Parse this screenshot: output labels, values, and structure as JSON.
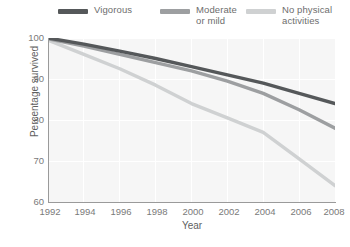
{
  "chart_data": {
    "type": "line",
    "title": "",
    "xlabel": "Year",
    "ylabel": "Percentage survived",
    "xlim": [
      1992,
      2008
    ],
    "ylim": [
      60,
      100
    ],
    "xticks": [
      1992,
      1994,
      1996,
      1998,
      2000,
      2002,
      2004,
      2006,
      2008
    ],
    "yticks": [
      60,
      70,
      80,
      90,
      100
    ],
    "grid": true,
    "legend_position": "top",
    "x": [
      1992,
      1994,
      1996,
      1998,
      2000,
      2002,
      2004,
      2006,
      2008
    ],
    "series": [
      {
        "name": "Vigorous",
        "color": "#55585a",
        "values": [
          100,
          98.5,
          96.8,
          95.0,
          93.0,
          91.0,
          89.0,
          86.5,
          84.0
        ]
      },
      {
        "name": "Moderate or mild",
        "color": "#9d9fa1",
        "values": [
          99.8,
          98.0,
          96.0,
          94.0,
          92.0,
          89.5,
          86.5,
          82.5,
          78.0
        ]
      },
      {
        "name": "No physical activities",
        "color": "#cfd1d2",
        "values": [
          99.5,
          96.0,
          92.5,
          88.5,
          84.0,
          80.5,
          77.0,
          70.5,
          64.0
        ]
      }
    ]
  },
  "legend": {
    "items": [
      {
        "label": "Vigorous",
        "color": "#55585a"
      },
      {
        "label": "Moderate\nor mild",
        "color": "#9d9fa1"
      },
      {
        "label": "No physical\nactivities",
        "color": "#cfd1d2"
      }
    ]
  },
  "axes": {
    "y_label": "Percentage survived",
    "x_label": "Year",
    "y_ticks": [
      "100",
      "90",
      "80",
      "70",
      "60"
    ],
    "x_ticks": [
      "1992",
      "1994",
      "1996",
      "1998",
      "2000",
      "2002",
      "2004",
      "2006",
      "2008"
    ]
  },
  "caption": {
    "text": ""
  },
  "colors": {
    "plot_background": "#f6f6f6",
    "gridline": "#ffffff",
    "axis": "#9a9a9a",
    "tick_text": "#7a7a7a",
    "label_text": "#5f5f5f"
  }
}
